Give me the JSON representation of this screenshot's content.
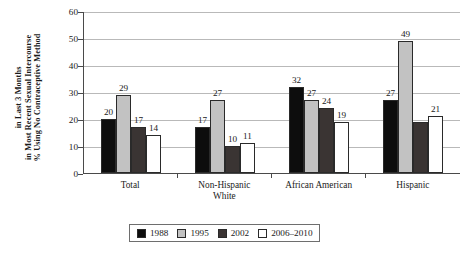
{
  "chart_data": {
    "type": "bar",
    "title": "",
    "xlabel": "",
    "ylabel_lines": [
      "% Using No Contraceptive Method",
      "in Most Recent Sexual Intercourse",
      "in Last 3 Months"
    ],
    "ylabel": "% Using No Contraceptive Method in Most Recent Sexual Intercourse in Last 3 Months",
    "ylim": [
      0,
      60
    ],
    "yticks": [
      0,
      10,
      20,
      30,
      40,
      50,
      60
    ],
    "ytick_labels": [
      "0",
      "10",
      "20",
      "30",
      "40",
      "50",
      "60"
    ],
    "grid": true,
    "legend_position": "bottom",
    "categories": [
      "Total",
      "Non-Hispanic White",
      "African American",
      "Hispanic"
    ],
    "category_label_lines": [
      [
        "Total"
      ],
      [
        "Non-Hispanic",
        "White"
      ],
      [
        "African American"
      ],
      [
        "Hispanic"
      ]
    ],
    "series": [
      {
        "name": "1988",
        "color": "#0d0d0d",
        "values": [
          20,
          17,
          32,
          27
        ],
        "labels": [
          "20",
          "17",
          "32",
          "27"
        ]
      },
      {
        "name": "1995",
        "color": "#c2c2c2",
        "values": [
          29,
          27,
          27,
          49
        ],
        "labels": [
          "29",
          "27",
          "27",
          "49"
        ]
      },
      {
        "name": "2002",
        "color": "#3a3433",
        "values": [
          17,
          10,
          24,
          19
        ],
        "labels": [
          "17",
          "10",
          "24",
          ""
        ]
      },
      {
        "name": "2006–2010",
        "color": "#ffffff",
        "values": [
          14,
          11,
          19,
          21
        ],
        "labels": [
          "14",
          "11",
          "19",
          "21"
        ]
      }
    ]
  },
  "legend": {
    "items": [
      {
        "label": "1988",
        "color": "#0d0d0d"
      },
      {
        "label": "1995",
        "color": "#c2c2c2"
      },
      {
        "label": "2002",
        "color": "#3a3433"
      },
      {
        "label": "2006–2010",
        "color": "#ffffff"
      }
    ]
  }
}
